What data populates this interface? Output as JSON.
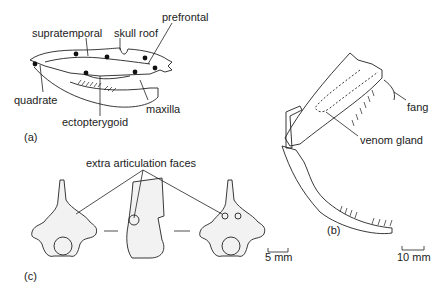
{
  "figure": {
    "panels": [
      {
        "id": "a",
        "tag": "(a)",
        "subject": "snake skull, lateral view",
        "labels": {
          "supratemporal": "supratemporal",
          "skull_roof": "skull roof",
          "prefrontal": "prefrontal",
          "quadrate": "quadrate",
          "maxilla": "maxilla",
          "ectopterygoid": "ectopterygoid"
        }
      },
      {
        "id": "b",
        "tag": "(b)",
        "subject": "viper head, fang apparatus",
        "labels": {
          "fang": "fang",
          "venom_gland": "venom gland"
        },
        "scale_bar": "10 mm"
      },
      {
        "id": "c",
        "tag": "(c)",
        "subject": "snake vertebrae",
        "labels": {
          "extra_articulation_faces": "extra articulation faces"
        },
        "scale_bar": "5 mm"
      }
    ]
  }
}
